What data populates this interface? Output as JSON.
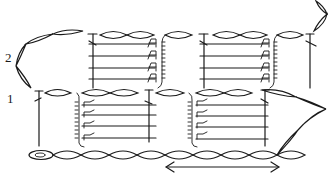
{
  "diagram": {
    "type": "crochet-stitch-chart",
    "row_labels": [
      {
        "label": "2",
        "x": 5,
        "y": 57
      },
      {
        "label": "1",
        "x": 7,
        "y": 98
      }
    ],
    "colors": {
      "ink": "#1a1a1a",
      "background": "#ffffff"
    },
    "repeat_indicator": {
      "symbol": "double-headed-arrow",
      "x1": 165,
      "x2": 278,
      "y": 167
    },
    "start_marker": "slip-knot-oval",
    "stitch_legend_shapes": [
      "chain-oval",
      "tall-stitch-T",
      "crossbar",
      "hook-A",
      "bobble-column",
      "slip-knot"
    ]
  }
}
